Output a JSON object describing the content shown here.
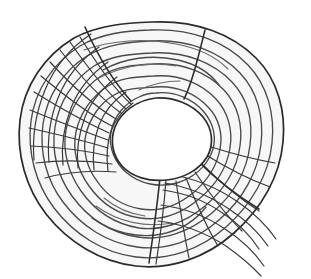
{
  "figure": {
    "name": "tree-trunk-cross-section",
    "title": "Tree trunk cross-section with growth rings",
    "background_color": "#ffffff",
    "fill_color": "#f7f7f7",
    "pith_fill_color": "#ffffff",
    "outline_color": "#2b2b2b",
    "ring_color": "#4a4a4a",
    "ray_color": "#3a3a3a",
    "divider_color": "#2e2e2e",
    "outline_width": 1.7,
    "ring_width": 1.35,
    "ray_width": 1.2,
    "divider_width": 1.6,
    "canvas": {
      "width": 311,
      "height": 279,
      "view_box": "0 0 311 279"
    },
    "center": {
      "x": 155,
      "y": 135
    },
    "counts": {
      "growth_rings": 9,
      "sectors_with_rays": 2,
      "upper_left_rays": 11,
      "lower_right_rays": 7,
      "sector_dividers": 4
    },
    "outer_boundary_path": "M 152 22 C 196 20 232 34 256 58 C 278 80 286 112 283 142 C 280 176 262 208 234 233 C 206 258 170 270 136 266 C 100 262 68 242 46 214 C 26 188 16 154 20 120 C 24 86 44 56 74 38 C 98 25 126 23 152 22 Z",
    "pith_hole_path": "M 156 98 C 174 97 192 104 203 117 C 213 129 214 145 207 157 C 199 170 184 178 167 180 C 149 182 132 177 122 166 C 112 155 110 140 115 127 C 121 112 137 100 156 98 Z",
    "growth_rings": [
      {
        "index": 1,
        "label": "ring-1-outermost",
        "path": "M 150 30 C 192 28 226 42 248 65 C 268 86 275 115 272 143 C 269 174 252 204 226 227 C 200 250 167 261 136 257 C 103 253 74 234 54 208 C 36 184 27 153 31 121 C 35 90 53 63 80 46 C 102 33 126 31 150 30"
      },
      {
        "index": 2,
        "label": "ring-2",
        "path": "M 151 41 C 189 39 220 52 240 73 C 258 92 264 118 261 144 C 258 172 243 199 219 220 C 195 241 165 251 137 247 C 107 243 81 226 63 202 C 47 181 39 153 43 124 C 47 96 63 71 87 56 C 107 44 129 42 151 41"
      },
      {
        "index": 3,
        "label": "ring-3",
        "path": "M 152 53 C 186 51 214 63 232 82 C 248 99 253 122 250 145 C 247 170 234 194 212 213 C 190 232 163 241 138 237 C 111 233 88 218 72 196 C 58 177 51 152 55 127 C 59 102 73 80 94 66 C 112 55 132 54 152 53"
      },
      {
        "index": 4,
        "label": "ring-4",
        "path": "M 153 64 C 183 62 208 73 224 90 C 238 105 243 126 240 146 C 237 168 225 189 205 206 C 185 223 161 231 139 228 C 115 224 95 211 81 191 C 69 174 62 152 66 130 C 70 108 83 88 101 76 C 117 66 135 65 153 64"
      },
      {
        "index": 5,
        "label": "ring-5",
        "path": "M 154 76 C 180 74 202 84 216 99 C 228 112 233 130 230 148 C 227 167 216 185 199 199 C 181 214 160 221 140 218 C 119 215 101 203 89 186 C 78 171 72 151 76 132 C 80 113 92 96 108 86 C 122 77 138 77 154 76"
      },
      {
        "index": 6,
        "label": "ring-6",
        "path": "M 155 87 C 177 85 196 94 208 107 C 219 118 223 134 220 149 C 217 166 207 181 193 193 C 177 206 159 212 141 209 C 123 206 107 196 97 181 C 87 168 82 150 86 134 C 90 118 100 103 114 95 C 126 88 141 88 155 87"
      },
      {
        "index": 7,
        "label": "ring-7-innermost",
        "path": "M 156 93 C 175 91 193 99 204 112 C 214 124 217 139 212 152 C 206 167 193 178 177 183 C 159 188 140 184 127 173 C 115 163 108 147 111 132 C 114 116 125 103 139 97 C 145 94 151 93 156 93"
      },
      {
        "index": 8,
        "label": "ring-partial-upper-inner",
        "path": "M 103 70 C 124 58 152 54 178 60 C 196 64 210 73 219 85"
      },
      {
        "index": 9,
        "label": "ring-partial-lower-inner",
        "path": "M 92 218 C 112 232 138 239 162 234 C 181 230 196 220 206 207"
      }
    ],
    "inner_accent_arcs": [
      {
        "label": "accent-arc-top",
        "path": "M 84 50 C 112 40 146 38 176 44 C 198 48 216 57 228 69"
      },
      {
        "label": "accent-arc-upper-mid",
        "path": "M 97 79 C 121 66 150 61 176 66"
      },
      {
        "label": "accent-arc-upper-short",
        "path": "M 139 90 C 152 84 166 81 180 81"
      },
      {
        "label": "accent-arc-lower-left",
        "path": "M 96 206 C 118 222 146 228 172 223"
      },
      {
        "label": "accent-arc-lower-short",
        "path": "M 104 198 C 116 208 130 214 145 216"
      }
    ],
    "sector_dividers": [
      {
        "label": "divider-top-left",
        "path": "M 85 27 C 97 54 112 80 131 101"
      },
      {
        "label": "divider-top-right",
        "path": "M 205 30 C 198 58 192 83 184 99"
      },
      {
        "label": "divider-bottom-left",
        "path": "M 160 178 C 157 206 153 236 149 263"
      },
      {
        "label": "divider-bottom-right",
        "path": "M 197 160 C 216 180 238 196 259 209"
      }
    ],
    "upper_left_rays": [
      {
        "label": "ray-ul-1",
        "path": "M 80 37 C 96 62 112 87 131 104"
      },
      {
        "label": "ray-ul-2",
        "path": "M 70 42 C 88 68 106 92 126 109"
      },
      {
        "label": "ray-ul-3",
        "path": "M 60 50 C 80 76 100 98 121 113"
      },
      {
        "label": "ray-ul-4",
        "path": "M 50 62 C 72 86 94 106 116 119"
      },
      {
        "label": "ray-ul-5",
        "path": "M 41 76 C 65 96 88 114 112 126"
      },
      {
        "label": "ray-ul-6",
        "path": "M 34 92 C 60 108 85 122 109 133"
      },
      {
        "label": "ray-ul-7",
        "path": "M 30 110 C 57 121 83 131 108 140"
      },
      {
        "label": "ray-ul-8",
        "path": "M 29 128 C 56 134 82 140 108 148"
      },
      {
        "label": "ray-ul-9",
        "path": "M 31 146 C 57 147 83 150 109 156"
      },
      {
        "label": "ray-ul-10",
        "path": "M 36 163 C 61 160 85 160 112 164"
      },
      {
        "label": "ray-ul-11",
        "path": "M 45 178 C 67 172 90 170 116 172"
      }
    ],
    "lower_right_rays": [
      {
        "label": "ray-lr-1",
        "path": "M 166 180 C 164 208 160 238 156 264"
      },
      {
        "label": "ray-lr-2",
        "path": "M 176 181 C 180 208 184 234 189 258"
      },
      {
        "label": "ray-lr-3",
        "path": "M 186 178 C 196 203 206 226 218 246"
      },
      {
        "label": "ray-lr-4",
        "path": "M 195 172 C 210 194 225 214 242 231"
      },
      {
        "label": "ray-lr-5",
        "path": "M 202 164 C 220 182 239 198 259 211"
      },
      {
        "label": "ray-lr-6",
        "path": "M 206 155 C 227 168 248 179 270 187"
      },
      {
        "label": "ray-lr-7",
        "path": "M 208 146 C 230 153 252 159 275 163"
      }
    ],
    "upper_left_mesh_arcs": [
      {
        "label": "mesh-arc-ul-1",
        "path": "M 91 34 C 70 48 54 68 45 90 C 36 112 32 136 34 160"
      },
      {
        "label": "mesh-arc-ul-2",
        "path": "M 99 47 C 80 60 66 78 58 98 C 50 118 47 140 49 162"
      },
      {
        "label": "mesh-arc-ul-3",
        "path": "M 108 62 C 91 74 78 90 71 108 C 64 126 61 145 63 165"
      },
      {
        "label": "mesh-arc-ul-4",
        "path": "M 117 77 C 102 88 91 102 85 117 C 79 133 76 150 78 168"
      },
      {
        "label": "mesh-arc-ul-5",
        "path": "M 126 92 C 113 101 104 112 99 125 C 94 139 92 153 94 170"
      },
      {
        "label": "mesh-arc-ul-6",
        "path": "M 133 103 C 122 111 115 120 111 131 C 107 143 106 155 108 171"
      }
    ],
    "lower_right_mesh_arcs": [
      {
        "label": "mesh-arc-lr-1",
        "path": "M 163 190 C 184 193 204 200 221 212 C 237 222 250 235 259 249"
      },
      {
        "label": "mesh-arc-lr-2",
        "path": "M 161 205 C 184 208 206 216 225 229 C 242 240 255 253 264 266"
      },
      {
        "label": "mesh-arc-lr-3",
        "path": "M 158 221 C 183 224 206 233 226 246 C 240 256 252 266 261 276"
      },
      {
        "label": "mesh-arc-lr-4",
        "path": "M 165 183 C 188 187 210 196 229 209 C 246 220 259 233 268 246"
      },
      {
        "label": "mesh-arc-lr-5",
        "path": "M 168 174 C 194 178 218 188 238 202 C 254 213 267 226 276 239"
      }
    ]
  }
}
